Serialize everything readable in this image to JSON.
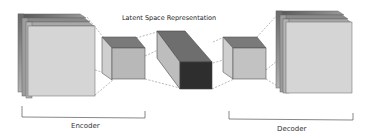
{
  "diagram": {
    "title": "Latent Space Representation",
    "encoder_label": "Encoder",
    "decoder_label": "Decoder",
    "colors": {
      "face_light": "#d6d6d6",
      "face_mid": "#bdbdbd",
      "top_dark": "#7a7a7a",
      "latent_front": "#2e2e2e",
      "latent_top": "#6e6e6e",
      "outline": "#555555",
      "dashed": "#8a8a8a"
    },
    "blocks": [
      {
        "name": "encoder-input",
        "type": "stacked-layers"
      },
      {
        "name": "encoder-hidden",
        "type": "cube"
      },
      {
        "name": "latent",
        "type": "cuboid"
      },
      {
        "name": "decoder-hidden",
        "type": "cube"
      },
      {
        "name": "decoder-output",
        "type": "stacked-layers"
      }
    ]
  }
}
